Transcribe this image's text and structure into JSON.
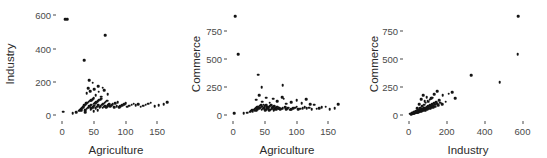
{
  "figure": {
    "background": "#ffffff",
    "point_color": "#141414",
    "text_color": "#2b2b2b",
    "tick_color": "#4a4a4a",
    "panel_count": 3
  },
  "chart_data": [
    {
      "type": "scatter",
      "title": "",
      "xlabel": "Agriculture",
      "ylabel": "Industry",
      "xlim": [
        -8,
        178
      ],
      "ylim": [
        -30,
        620
      ],
      "xticks": [
        0,
        50,
        100,
        150
      ],
      "yticks": [
        0,
        200,
        400,
        600
      ],
      "grid": false,
      "legend": "none",
      "x": [
        5,
        8,
        2,
        17,
        22,
        26,
        28,
        30,
        31,
        33,
        34,
        35,
        36,
        37,
        38,
        39,
        40,
        41,
        42,
        43,
        44,
        45,
        46,
        46,
        47,
        48,
        49,
        50,
        50,
        51,
        52,
        53,
        54,
        55,
        56,
        57,
        58,
        59,
        60,
        61,
        62,
        63,
        64,
        65,
        66,
        67,
        68,
        69,
        70,
        71,
        72,
        73,
        74,
        76,
        78,
        80,
        82,
        84,
        86,
        88,
        90,
        92,
        95,
        98,
        100,
        103,
        106,
        110,
        113,
        116,
        120,
        124,
        128,
        132,
        136,
        140,
        146,
        152,
        160,
        166,
        39,
        41,
        44,
        48,
        53,
        57,
        62,
        66,
        72,
        35,
        43,
        51,
        58,
        64,
        30,
        36,
        45,
        50,
        56,
        68
      ],
      "y": [
        575,
        578,
        20,
        12,
        18,
        25,
        30,
        35,
        42,
        48,
        55,
        60,
        28,
        65,
        70,
        38,
        75,
        45,
        80,
        52,
        85,
        58,
        90,
        40,
        62,
        95,
        48,
        68,
        100,
        55,
        72,
        42,
        78,
        50,
        82,
        58,
        88,
        46,
        92,
        54,
        98,
        62,
        44,
        68,
        50,
        74,
        56,
        80,
        48,
        86,
        54,
        60,
        66,
        52,
        58,
        64,
        46,
        70,
        52,
        76,
        48,
        54,
        60,
        66,
        72,
        50,
        56,
        62,
        68,
        58,
        64,
        50,
        56,
        62,
        68,
        74,
        52,
        58,
        64,
        78,
        130,
        160,
        145,
        195,
        120,
        175,
        110,
        150,
        125,
        330,
        210,
        155,
        140,
        165,
        25,
        18,
        32,
        22,
        28,
        480
      ],
      "notes": "Swiss-style data; two extreme Industry outliers near 575-580 at low Agriculture, one near 480 at Agriculture ~80, one near 330 at Agriculture ~40"
    },
    {
      "type": "scatter",
      "title": "",
      "xlabel": "Agriculture",
      "ylabel": "Commerce",
      "xlim": [
        -8,
        178
      ],
      "ylim": [
        -45,
        920
      ],
      "xticks": [
        0,
        50,
        100,
        150
      ],
      "yticks": [
        0,
        250,
        500,
        750
      ],
      "grid": false,
      "legend": "none",
      "x": [
        3,
        8,
        40,
        45,
        78,
        2,
        17,
        22,
        26,
        28,
        30,
        31,
        33,
        34,
        35,
        36,
        37,
        38,
        39,
        40,
        41,
        42,
        43,
        44,
        45,
        46,
        47,
        48,
        49,
        50,
        51,
        52,
        53,
        54,
        55,
        56,
        57,
        58,
        59,
        60,
        61,
        62,
        63,
        64,
        65,
        66,
        67,
        68,
        69,
        70,
        71,
        72,
        73,
        74,
        76,
        78,
        80,
        82,
        84,
        86,
        88,
        90,
        92,
        95,
        98,
        100,
        103,
        106,
        110,
        113,
        116,
        120,
        124,
        128,
        132,
        136,
        140,
        146,
        152,
        160,
        166,
        36,
        41,
        46,
        52,
        58,
        63,
        70,
        77,
        84,
        92,
        100,
        108,
        115,
        122
      ],
      "y": [
        880,
        545,
        360,
        250,
        265,
        15,
        18,
        22,
        28,
        35,
        42,
        30,
        48,
        55,
        38,
        62,
        45,
        68,
        52,
        75,
        58,
        82,
        65,
        88,
        48,
        72,
        55,
        92,
        62,
        78,
        45,
        85,
        52,
        68,
        58,
        75,
        42,
        80,
        48,
        86,
        55,
        62,
        70,
        45,
        76,
        52,
        58,
        65,
        48,
        72,
        55,
        60,
        66,
        50,
        56,
        62,
        145,
        68,
        52,
        58,
        64,
        48,
        54,
        60,
        66,
        72,
        50,
        56,
        62,
        68,
        58,
        64,
        50,
        90,
        56,
        62,
        68,
        74,
        52,
        58,
        95,
        135,
        175,
        120,
        155,
        110,
        145,
        125,
        160,
        100,
        115,
        130,
        105,
        140,
        95
      ],
      "notes": "Commerce vs Agriculture; one extreme near 880 at Agriculture ~3, one near 545 at ~8"
    },
    {
      "type": "scatter",
      "title": "",
      "xlabel": "Industry",
      "ylabel": "Commerce",
      "xlim": [
        -25,
        650
      ],
      "ylim": [
        -45,
        920
      ],
      "xticks": [
        0,
        200,
        400,
        600
      ],
      "yticks": [
        0,
        250,
        500,
        750
      ],
      "grid": false,
      "legend": "none",
      "x": [
        578,
        575,
        480,
        330,
        245,
        230,
        210,
        195,
        180,
        175,
        165,
        160,
        155,
        150,
        145,
        140,
        138,
        135,
        130,
        128,
        125,
        122,
        120,
        118,
        115,
        112,
        110,
        108,
        105,
        102,
        100,
        98,
        95,
        92,
        90,
        88,
        85,
        82,
        80,
        78,
        76,
        74,
        72,
        70,
        68,
        66,
        64,
        62,
        60,
        58,
        56,
        54,
        52,
        50,
        48,
        46,
        44,
        42,
        40,
        38,
        36,
        34,
        32,
        30,
        28,
        26,
        24,
        22,
        20,
        18,
        16,
        14,
        12,
        45,
        55,
        65,
        75,
        85,
        95,
        105,
        115,
        125,
        135,
        150,
        30,
        40,
        50,
        60,
        70,
        80,
        90,
        100,
        110,
        120,
        5
      ],
      "y": [
        880,
        545,
        295,
        355,
        150,
        205,
        190,
        120,
        175,
        95,
        110,
        130,
        85,
        100,
        115,
        75,
        90,
        105,
        70,
        82,
        95,
        65,
        78,
        88,
        60,
        72,
        85,
        55,
        68,
        80,
        62,
        50,
        72,
        58,
        45,
        65,
        52,
        60,
        42,
        55,
        48,
        38,
        52,
        45,
        35,
        48,
        40,
        32,
        44,
        36,
        28,
        40,
        33,
        25,
        36,
        30,
        22,
        32,
        26,
        20,
        28,
        23,
        18,
        25,
        20,
        15,
        22,
        17,
        13,
        18,
        14,
        10,
        8,
        58,
        95,
        140,
        175,
        125,
        160,
        118,
        145,
        155,
        185,
        210,
        24,
        35,
        48,
        62,
        78,
        92,
        108,
        122,
        138,
        150,
        12
      ],
      "notes": "Strong positive correlation; dense wedge near origin, outliers at Industry ~575-580"
    }
  ],
  "panels": [
    {
      "name": "industry-vs-agriculture",
      "ylabel": "Industry",
      "xlabel": "Agriculture",
      "ytick_labels": [
        "600",
        "400",
        "200",
        "0"
      ],
      "xtick_labels": [
        "0",
        "50",
        "100",
        "150"
      ]
    },
    {
      "name": "commerce-vs-agriculture",
      "ylabel": "Commerce",
      "xlabel": "Agriculture",
      "ytick_labels": [
        "750",
        "500",
        "250",
        "0"
      ],
      "xtick_labels": [
        "0",
        "50",
        "100",
        "150"
      ]
    },
    {
      "name": "commerce-vs-industry",
      "ylabel": "Commerce",
      "xlabel": "Industry",
      "ytick_labels": [
        "750",
        "500",
        "250",
        "0"
      ],
      "xtick_labels": [
        "0",
        "200",
        "400",
        "600"
      ]
    }
  ]
}
